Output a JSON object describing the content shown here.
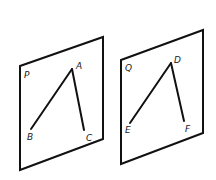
{
  "diagram": {
    "planes": [
      {
        "label": "P",
        "points": {
          "A": "A",
          "B": "B",
          "C": "C"
        }
      },
      {
        "label": "Q",
        "points": {
          "D": "D",
          "E": "E",
          "F": "F"
        }
      }
    ],
    "colors": {
      "stroke": "#111111",
      "background": "#ffffff"
    }
  }
}
